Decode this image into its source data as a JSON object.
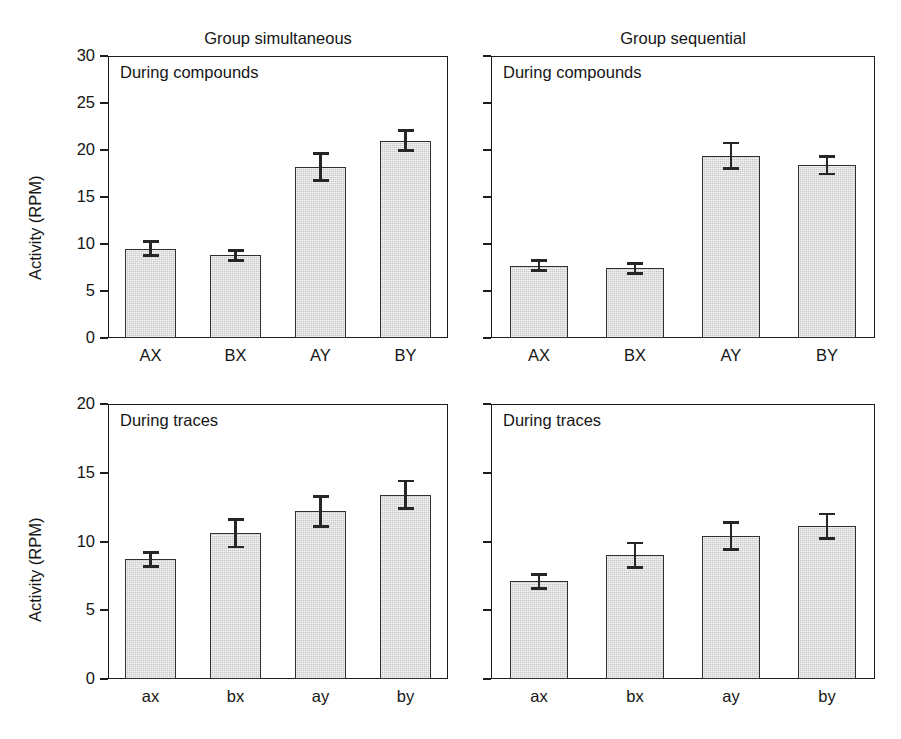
{
  "figure": {
    "width": 901,
    "height": 739,
    "background": "#ffffff",
    "bar_fill_color": "#c9c9c9",
    "bar_edge_color": "#303030",
    "axis_color": "#1d1d1d",
    "text_color": "#161616"
  },
  "chart_data": {
    "type": "bar",
    "title": "",
    "grid": false,
    "legend": "none",
    "layout": "2 rows x 2 columns of panels; columns share group titles, rows share y-axis",
    "column_titles": [
      "Group simultaneous",
      "Group sequential"
    ],
    "ylabel": "Activity (RPM)",
    "xlabel": "",
    "panels": [
      {
        "row": 0,
        "col": 0,
        "group": "Group simultaneous",
        "note": "During compounds",
        "categories": [
          "AX",
          "BX",
          "AY",
          "BY"
        ],
        "values": [
          9.5,
          8.8,
          18.2,
          21.0
        ],
        "errors": [
          0.9,
          0.7,
          1.6,
          1.2
        ],
        "ylim": [
          0,
          30
        ],
        "yticks": [
          0,
          5,
          10,
          15,
          20,
          25,
          30
        ],
        "ytick_labels": [
          "0",
          "5",
          "10",
          "15",
          "20",
          "25",
          "30"
        ],
        "show_ytick_labels": true
      },
      {
        "row": 0,
        "col": 1,
        "group": "Group sequential",
        "note": "During compounds",
        "categories": [
          "AX",
          "BX",
          "AY",
          "BY"
        ],
        "values": [
          7.7,
          7.4,
          19.4,
          18.4
        ],
        "errors": [
          0.7,
          0.7,
          1.5,
          1.1
        ],
        "ylim": [
          0,
          30
        ],
        "yticks": [
          0,
          5,
          10,
          15,
          20,
          25,
          30
        ],
        "ytick_labels": [
          "0",
          "5",
          "10",
          "15",
          "20",
          "25",
          "30"
        ],
        "show_ytick_labels": false
      },
      {
        "row": 1,
        "col": 0,
        "group": "Group simultaneous",
        "note": "During traces",
        "categories": [
          "ax",
          "bx",
          "ay",
          "by"
        ],
        "values": [
          8.7,
          10.6,
          12.2,
          13.4
        ],
        "errors": [
          0.6,
          1.1,
          1.2,
          1.1
        ],
        "ylim": [
          0,
          20
        ],
        "yticks": [
          0,
          5,
          10,
          15,
          20
        ],
        "ytick_labels": [
          "0",
          "5",
          "10",
          "15",
          "20"
        ],
        "show_ytick_labels": true
      },
      {
        "row": 1,
        "col": 1,
        "group": "Group sequential",
        "note": "During traces",
        "categories": [
          "ax",
          "bx",
          "ay",
          "by"
        ],
        "values": [
          7.1,
          9.0,
          10.4,
          11.1
        ],
        "errors": [
          0.6,
          1.0,
          1.1,
          1.0
        ],
        "ylim": [
          0,
          20
        ],
        "yticks": [
          0,
          5,
          10,
          15,
          20
        ],
        "ytick_labels": [
          "0",
          "5",
          "10",
          "15",
          "20"
        ],
        "show_ytick_labels": false
      }
    ]
  }
}
